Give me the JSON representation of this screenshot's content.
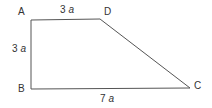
{
  "figure": {
    "type": "trapezoid",
    "vertices": [
      {
        "name": "A",
        "x": 31,
        "y": 20
      },
      {
        "name": "D",
        "x": 100,
        "y": 19
      },
      {
        "name": "C",
        "x": 190,
        "y": 88
      },
      {
        "name": "B",
        "x": 31,
        "y": 89
      }
    ],
    "labels": {
      "A": "A",
      "B": "B",
      "C": "C",
      "D": "D"
    },
    "sides": {
      "AD": {
        "num": "3",
        "var": "a"
      },
      "AB": {
        "num": "3",
        "var": "a"
      },
      "BC": {
        "num": "7",
        "var": "a"
      }
    },
    "stroke_color": "#555555"
  }
}
